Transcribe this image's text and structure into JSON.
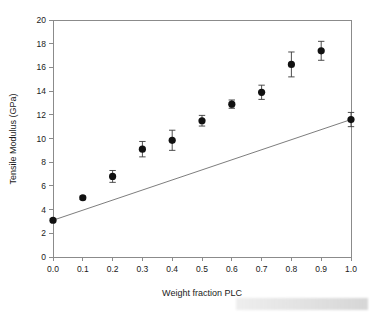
{
  "chart_data": {
    "type": "scatter",
    "title": "",
    "xlabel": "Weight fraction PLC",
    "ylabel": "Tensile Modulus (GPa)",
    "xlim": [
      0.0,
      1.0
    ],
    "ylim": [
      0,
      20
    ],
    "xticks": [
      "0.0",
      "0.1",
      "0.2",
      "0.3",
      "0.4",
      "0.5",
      "0.6",
      "0.7",
      "0.8",
      "0.9",
      "1.0"
    ],
    "xtick_values": [
      0.0,
      0.1,
      0.2,
      0.3,
      0.4,
      0.5,
      0.6,
      0.7,
      0.8,
      0.9,
      1.0
    ],
    "yticks": [
      "0",
      "2",
      "4",
      "6",
      "8",
      "10",
      "12",
      "14",
      "16",
      "18",
      "20"
    ],
    "ytick_values": [
      0,
      2,
      4,
      6,
      8,
      10,
      12,
      14,
      16,
      18,
      20
    ],
    "grid": false,
    "legend": null,
    "x": [
      0.0,
      0.1,
      0.2,
      0.3,
      0.4,
      0.5,
      0.6,
      0.7,
      0.8,
      0.9,
      1.0
    ],
    "values": [
      3.1,
      5.0,
      6.8,
      9.1,
      9.85,
      11.5,
      12.9,
      13.9,
      16.25,
      17.4,
      11.6
    ],
    "yerr": [
      0.15,
      0.15,
      0.5,
      0.65,
      0.85,
      0.45,
      0.35,
      0.6,
      1.05,
      0.8,
      0.6
    ],
    "series": [
      {
        "name": "Tensile modulus (measured)",
        "marker": "filled-circle",
        "color": "#111111",
        "x": [
          0.0,
          0.1,
          0.2,
          0.3,
          0.4,
          0.5,
          0.6,
          0.7,
          0.8,
          0.9,
          1.0
        ],
        "values": [
          3.1,
          5.0,
          6.8,
          9.1,
          9.85,
          11.5,
          12.9,
          13.9,
          16.25,
          17.4,
          11.6
        ],
        "yerr": [
          0.15,
          0.15,
          0.5,
          0.65,
          0.85,
          0.45,
          0.35,
          0.6,
          1.05,
          0.8,
          0.6
        ]
      },
      {
        "name": "Rule of mixtures line",
        "marker": "none",
        "color": "#6e6e6e",
        "x": [
          0.0,
          1.0
        ],
        "values": [
          3.1,
          11.6
        ]
      }
    ]
  },
  "axes": {
    "x_title": "Weight fraction PLC",
    "y_title": "Tensile Modulus (GPa)"
  }
}
